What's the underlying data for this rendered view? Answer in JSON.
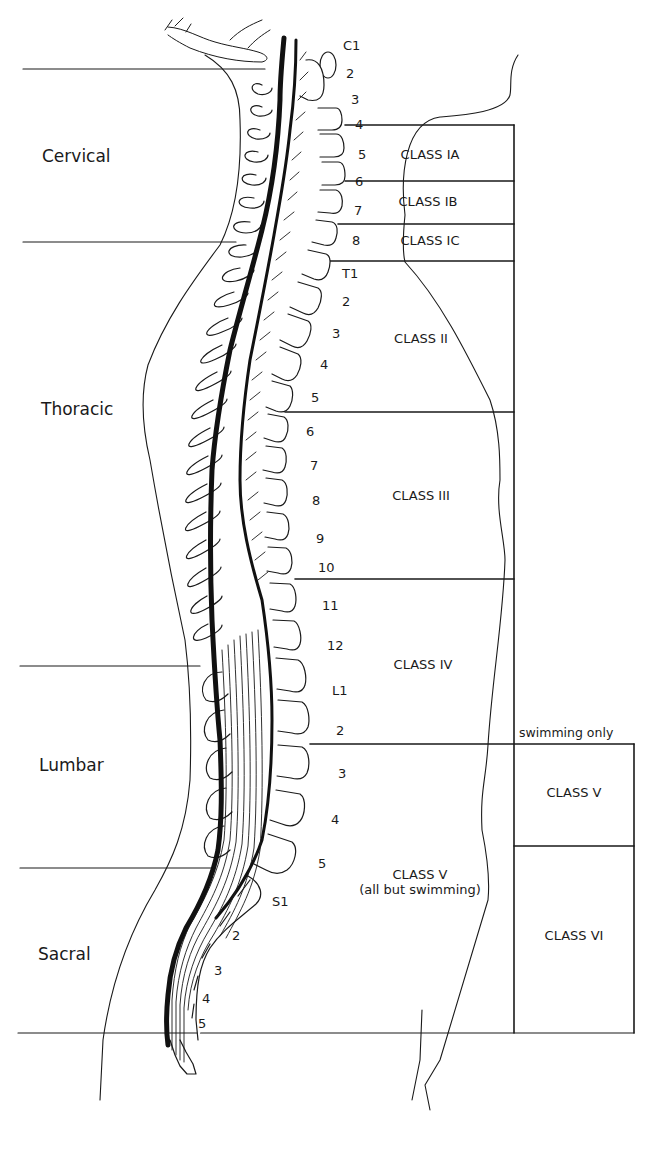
{
  "diagram": {
    "regions": [
      {
        "label": "Cervical",
        "y_label": 157,
        "y_top": 69,
        "y_bottom": 242
      },
      {
        "label": "Thoracic",
        "y_label": 410,
        "y_top": 242,
        "y_bottom": 666
      },
      {
        "label": "Lumbar",
        "y_label": 766,
        "y_top": 666,
        "y_bottom": 868
      },
      {
        "label": "Sacral",
        "y_label": 955,
        "y_top": 868,
        "y_bottom": 1033
      }
    ],
    "vertebrae": [
      {
        "label": "C1",
        "x": 343,
        "y": 46
      },
      {
        "label": "2",
        "x": 346,
        "y": 74
      },
      {
        "label": "3",
        "x": 351,
        "y": 100
      },
      {
        "label": "4",
        "x": 357,
        "y": 125
      },
      {
        "label": "5",
        "x": 358,
        "y": 155
      },
      {
        "label": "6",
        "x": 357,
        "y": 182
      },
      {
        "label": "7",
        "x": 354,
        "y": 211
      },
      {
        "label": "8",
        "x": 352,
        "y": 241
      },
      {
        "label": "T1",
        "x": 342,
        "y": 274
      },
      {
        "label": "2",
        "x": 342,
        "y": 302
      },
      {
        "label": "3",
        "x": 332,
        "y": 334
      },
      {
        "label": "4",
        "x": 320,
        "y": 365
      },
      {
        "label": "5",
        "x": 311,
        "y": 398
      },
      {
        "label": "6",
        "x": 306,
        "y": 432
      },
      {
        "label": "7",
        "x": 310,
        "y": 466
      },
      {
        "label": "8",
        "x": 312,
        "y": 501
      },
      {
        "label": "9",
        "x": 316,
        "y": 539
      },
      {
        "label": "10",
        "x": 318,
        "y": 568
      },
      {
        "label": "11",
        "x": 322,
        "y": 606
      },
      {
        "label": "12",
        "x": 327,
        "y": 646
      },
      {
        "label": "L1",
        "x": 332,
        "y": 691
      },
      {
        "label": "2",
        "x": 336,
        "y": 731
      },
      {
        "label": "3",
        "x": 338,
        "y": 774
      },
      {
        "label": "4",
        "x": 331,
        "y": 820
      },
      {
        "label": "5",
        "x": 318,
        "y": 864
      },
      {
        "label": "S1",
        "x": 272,
        "y": 902
      },
      {
        "label": "2",
        "x": 232,
        "y": 936
      },
      {
        "label": "3",
        "x": 214,
        "y": 971
      },
      {
        "label": "4",
        "x": 202,
        "y": 999
      },
      {
        "label": "5",
        "x": 198,
        "y": 1024
      }
    ],
    "classes": [
      {
        "label": "CLASS IA",
        "x": 430,
        "y": 157,
        "level_from": "C4",
        "level_to": "C6"
      },
      {
        "label": "CLASS IB",
        "x": 428,
        "y": 204,
        "level_from": "C6",
        "level_to": "C7"
      },
      {
        "label": "CLASS IC",
        "x": 430,
        "y": 243,
        "level_from": "C8",
        "level_to": "T1"
      },
      {
        "label": "CLASS II",
        "x": 421,
        "y": 341,
        "level_from": "T1",
        "level_to": "T5"
      },
      {
        "label": "CLASS III",
        "x": 421,
        "y": 498,
        "level_from": "T6",
        "level_to": "T10"
      },
      {
        "label": "CLASS IV",
        "x": 423,
        "y": 667,
        "level_from": "T11",
        "level_to": "L2"
      },
      {
        "label": "CLASS V",
        "sublabel": "(all but swimming)",
        "x": 420,
        "y": 885,
        "level_from": "L3",
        "level_to": "S5"
      }
    ],
    "swimming_column": {
      "header": "swimming only",
      "cells": [
        {
          "label": "CLASS V",
          "x": 573,
          "y": 795
        },
        {
          "label": "CLASS VI",
          "x": 573,
          "y": 938
        }
      ]
    }
  }
}
